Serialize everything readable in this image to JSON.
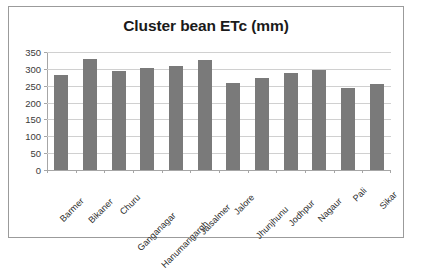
{
  "chart_data": {
    "type": "bar",
    "title": "Cluster bean ETc (mm)",
    "xlabel": "",
    "ylabel": "",
    "ylim": [
      0,
      350
    ],
    "ytick_step": 50,
    "yticks": [
      "350",
      "300",
      "250",
      "200",
      "150",
      "100",
      "50",
      "0"
    ],
    "grid": true,
    "legend": "none",
    "bar_color": "#7a7a7a",
    "categories": [
      "Barmer",
      "Bikaner",
      "Churu",
      "Ganganagar",
      "Hanumangargh",
      "Jaisalmer",
      "Jalore",
      "Jhunjhunu",
      "Jodhpur",
      "Nagaur",
      "Pali",
      "Sikar"
    ],
    "values": [
      282,
      330,
      293,
      304,
      309,
      325,
      257,
      272,
      289,
      298,
      244,
      254
    ]
  }
}
